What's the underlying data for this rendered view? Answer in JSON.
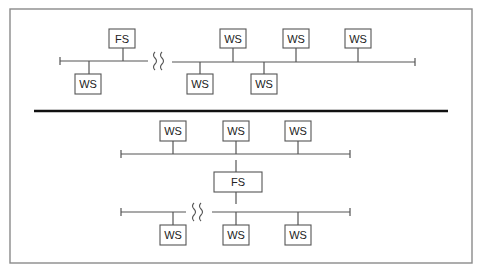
{
  "diagram": {
    "frame": {
      "x": 10,
      "y": 9,
      "w": 462,
      "h": 254,
      "stroke": "#8a8a8a"
    },
    "divider": {
      "x1": 34,
      "x2": 448,
      "y": 111,
      "stroke": "#111111",
      "width": 2.6
    },
    "line_color": "#555555",
    "box_stroke": "#555555",
    "top": {
      "buses": [
        {
          "x1": 60,
          "x2": 148,
          "y": 61,
          "cap_left": true,
          "cap_right": false
        },
        {
          "x1": 172,
          "x2": 415,
          "y": 62,
          "cap_left": false,
          "cap_right": true
        }
      ],
      "breaks": [
        {
          "x": 153,
          "y": 52,
          "label": "wan-link-break"
        }
      ],
      "nodes": [
        {
          "label": "FS",
          "x": 109,
          "y": 29,
          "w": 26,
          "h": 19,
          "drop_x": 123,
          "bus_y": 61,
          "side": "above"
        },
        {
          "label": "WS",
          "x": 75,
          "y": 74,
          "w": 26,
          "h": 20,
          "drop_x": 89,
          "bus_y": 61,
          "side": "below"
        },
        {
          "label": "WS",
          "x": 220,
          "y": 29,
          "w": 26,
          "h": 19,
          "drop_x": 233,
          "bus_y": 62,
          "side": "above"
        },
        {
          "label": "WS",
          "x": 283,
          "y": 29,
          "w": 26,
          "h": 19,
          "drop_x": 296,
          "bus_y": 62,
          "side": "above"
        },
        {
          "label": "WS",
          "x": 345,
          "y": 29,
          "w": 26,
          "h": 19,
          "drop_x": 358,
          "bus_y": 62,
          "side": "above"
        },
        {
          "label": "WS",
          "x": 187,
          "y": 74,
          "w": 26,
          "h": 20,
          "drop_x": 200,
          "bus_y": 62,
          "side": "below"
        },
        {
          "label": "WS",
          "x": 251,
          "y": 74,
          "w": 26,
          "h": 20,
          "drop_x": 264,
          "bus_y": 62,
          "side": "below"
        }
      ]
    },
    "bottom": {
      "buses": [
        {
          "x1": 121,
          "x2": 350,
          "y": 154,
          "cap_left": true,
          "cap_right": true
        },
        {
          "x1": 121,
          "x2": 186,
          "y": 212,
          "cap_left": true,
          "cap_right": false
        },
        {
          "x1": 212,
          "x2": 350,
          "y": 212,
          "cap_left": false,
          "cap_right": true
        }
      ],
      "breaks": [
        {
          "x": 192,
          "y": 203,
          "label": "wan-link-break"
        }
      ],
      "links": [
        {
          "x": 236,
          "y1": 160,
          "y2": 172
        },
        {
          "x": 236,
          "y1": 192,
          "y2": 204
        }
      ],
      "nodes": [
        {
          "label": "WS",
          "x": 160,
          "y": 121,
          "w": 26,
          "h": 20,
          "drop_x": 173,
          "bus_y": 154,
          "side": "above"
        },
        {
          "label": "WS",
          "x": 223,
          "y": 121,
          "w": 26,
          "h": 20,
          "drop_x": 236,
          "bus_y": 154,
          "side": "above"
        },
        {
          "label": "WS",
          "x": 285,
          "y": 121,
          "w": 26,
          "h": 20,
          "drop_x": 298,
          "bus_y": 154,
          "side": "above"
        },
        {
          "label": "FS",
          "x": 214,
          "y": 172,
          "w": 48,
          "h": 20,
          "drop_x": null,
          "bus_y": null,
          "side": "none"
        },
        {
          "label": "WS",
          "x": 160,
          "y": 225,
          "w": 26,
          "h": 20,
          "drop_x": 173,
          "bus_y": 212,
          "side": "below"
        },
        {
          "label": "WS",
          "x": 223,
          "y": 225,
          "w": 26,
          "h": 20,
          "drop_x": 236,
          "bus_y": 212,
          "side": "below"
        },
        {
          "label": "WS",
          "x": 285,
          "y": 225,
          "w": 26,
          "h": 20,
          "drop_x": 298,
          "bus_y": 212,
          "side": "below"
        }
      ]
    }
  }
}
